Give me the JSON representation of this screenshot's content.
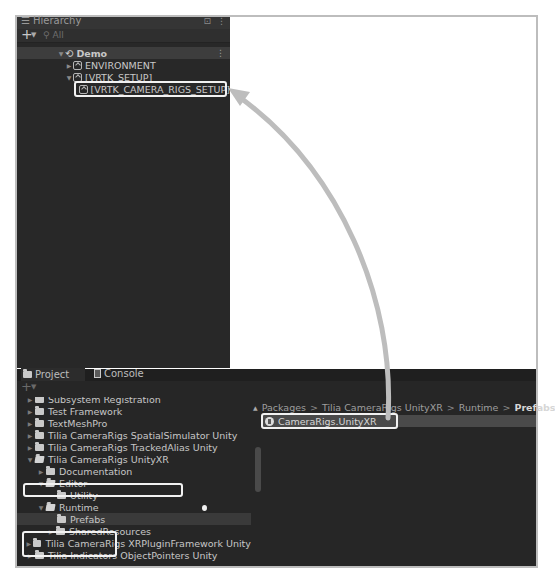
{
  "hierarchy": {
    "tab_label": "Hierarchy",
    "search_placeholder": "All",
    "scene": "Demo",
    "items": [
      {
        "label": "ENVIRONMENT",
        "expanded": false
      },
      {
        "label": "[VRTK_SETUP]",
        "expanded": true
      },
      {
        "label": "[VRTK_CAMERA_RIGS_SETUP]",
        "highlighted": true
      }
    ]
  },
  "project": {
    "tabs": [
      {
        "label": "Project",
        "icon": "folder-icon",
        "active": true
      },
      {
        "label": "Console",
        "icon": "console-icon",
        "active": false
      }
    ],
    "tree": [
      {
        "label": "Subsystem Registration",
        "depth": 0,
        "expanded": false
      },
      {
        "label": "Test Framework",
        "depth": 0,
        "expanded": false
      },
      {
        "label": "TextMeshPro",
        "depth": 0,
        "expanded": false
      },
      {
        "label": "Tilia CameraRigs SpatialSimulator Unity",
        "depth": 0,
        "expanded": false
      },
      {
        "label": "Tilia CameraRigs TrackedAlias Unity",
        "depth": 0,
        "expanded": false
      },
      {
        "label": "Tilia CameraRigs UnityXR",
        "depth": 0,
        "expanded": true,
        "highlighted": true
      },
      {
        "label": "Documentation",
        "depth": 1,
        "expanded": false
      },
      {
        "label": "Editor",
        "depth": 1,
        "expanded": true
      },
      {
        "label": "Utility",
        "depth": 2
      },
      {
        "label": "Runtime",
        "depth": 1,
        "expanded": true,
        "highlighted": true
      },
      {
        "label": "Prefabs",
        "depth": 2,
        "selected": true,
        "highlighted": true
      },
      {
        "label": "SharedResources",
        "depth": 2,
        "expanded": false
      },
      {
        "label": "Tilia CameraRigs XRPluginFramework Unity",
        "depth": 0,
        "expanded": false
      },
      {
        "label": "Tilia Indicators ObjectPointers Unity",
        "depth": 0,
        "expanded": false
      }
    ],
    "breadcrumb": [
      "Packages",
      "Tilia CameraRigs UnityXR",
      "Runtime",
      "Prefabs"
    ],
    "assets": [
      {
        "label": "CameraRigs.UnityXR",
        "icon": "prefab-icon",
        "highlighted": true
      }
    ]
  },
  "annotation": {
    "arrow": "drag CameraRigs.UnityXR prefab onto [VRTK_CAMERA_RIGS_SETUP]",
    "callout_color": "#f2f2f2",
    "arrow_color": "#bdbdbd"
  }
}
